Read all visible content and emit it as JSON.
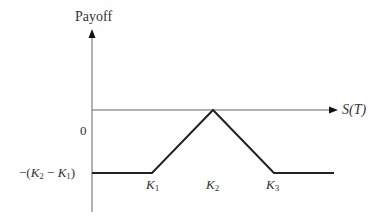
{
  "diagram": {
    "type": "butterfly spread payoff diagram",
    "y_axis_label": "Payoff",
    "x_axis_label": "S(T)",
    "y_ticks": [
      {
        "label": "0",
        "value": 0
      },
      {
        "label": "−(K₂ − K₁)",
        "value": "-(K2-K1)"
      }
    ],
    "x_labels": [
      "K1",
      "K2",
      "K3"
    ],
    "payoff_segments": [
      {
        "from": "0",
        "to": "K1",
        "payoff": "-(K2-K1)",
        "shape": "flat"
      },
      {
        "from": "K1",
        "to": "K2",
        "payoff": "rising",
        "shape": "slope +1"
      },
      {
        "from": "K2",
        "to": "K3",
        "payoff": "falling",
        "shape": "slope -1"
      },
      {
        "from": "K3",
        "to": "∞",
        "payoff": "-(K2-K1)",
        "shape": "flat"
      }
    ],
    "colors": {
      "axis": "#555555",
      "payoff_line": "#222222",
      "text": "#333333"
    }
  },
  "labels": {
    "payoff": "Payoff",
    "s_t": "S(T)",
    "zero": "0",
    "neg_prefix": "−(",
    "k": "K",
    "sub1": "1",
    "sub2": "2",
    "sub3": "3",
    "minus": " − ",
    "close": ")"
  }
}
